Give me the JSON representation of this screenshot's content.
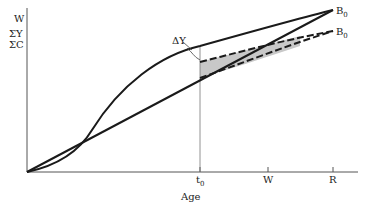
{
  "figure": {
    "y_axis_labels": [
      "W",
      "ΣY",
      "ΣC"
    ],
    "x_axis_title": "Age",
    "x_ticks": [
      {
        "label": "t",
        "subscript": "0"
      },
      {
        "label": "W"
      },
      {
        "label": "R"
      }
    ],
    "annotations": {
      "delta_y": "ΔY",
      "end_label_top": {
        "label": "B",
        "subscript": "0"
      },
      "end_label_bottom": {
        "label": "B",
        "subscript": "0"
      }
    },
    "colors": {
      "line": "#1a1a1a",
      "axis": "#555555",
      "shade": "#c8c8c8"
    }
  }
}
